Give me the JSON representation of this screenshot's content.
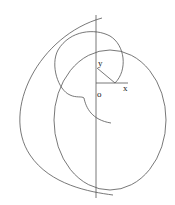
{
  "diagram": {
    "labels": {
      "y": "y",
      "origin": "o",
      "x": "x"
    },
    "elements": [
      "vertical-axis",
      "horizontal-x-segment",
      "diagonal-radius",
      "cardioid-like-curve",
      "large-circle",
      "outer-arc"
    ],
    "stroke_color": "#555555",
    "background": "#ffffff"
  }
}
